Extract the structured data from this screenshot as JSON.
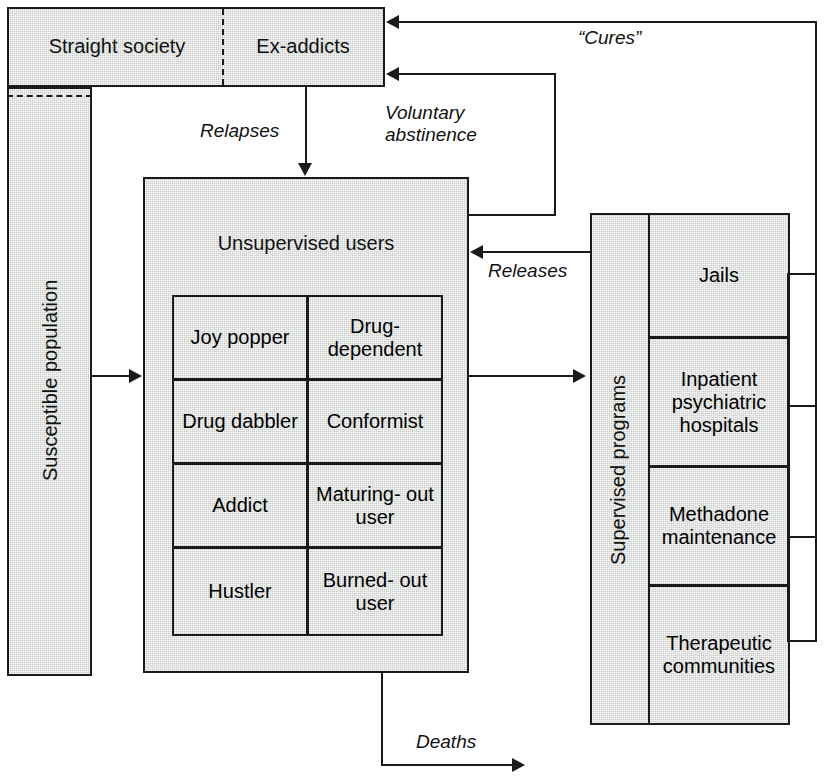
{
  "diagram": {
    "colors": {
      "box_fill": "#c9cdc9",
      "stroke": "#1a1a1a",
      "background": "#ffffff",
      "text": "#111111"
    },
    "top_box": {
      "left_label": "Straight society",
      "right_label": "Ex-addicts",
      "divider": "dashed"
    },
    "left_box": {
      "label": "Susceptible population",
      "orientation": "vertical"
    },
    "center_box": {
      "title": "Unsupervised users",
      "grid": {
        "rows": [
          {
            "left": "Joy\npopper",
            "right": "Drug-\ndependent"
          },
          {
            "left": "Drug\ndabbler",
            "right": "Conformist"
          },
          {
            "left": "Addict",
            "right": "Maturing-\nout user"
          },
          {
            "left": "Hustler",
            "right": "Burned-\nout user"
          }
        ]
      }
    },
    "right_box": {
      "label": "Supervised programs",
      "orientation": "vertical",
      "programs": [
        "Jails",
        "Inpatient\npsychiatric\nhospitals",
        "Methadone\nmaintenance",
        "Therapeutic\ncommunities"
      ]
    },
    "flow_labels": {
      "cures": "“Cures”",
      "relapses": "Relapses",
      "voluntary_abstinence": "Voluntary\nabstinence",
      "releases": "Releases",
      "deaths": "Deaths"
    }
  }
}
